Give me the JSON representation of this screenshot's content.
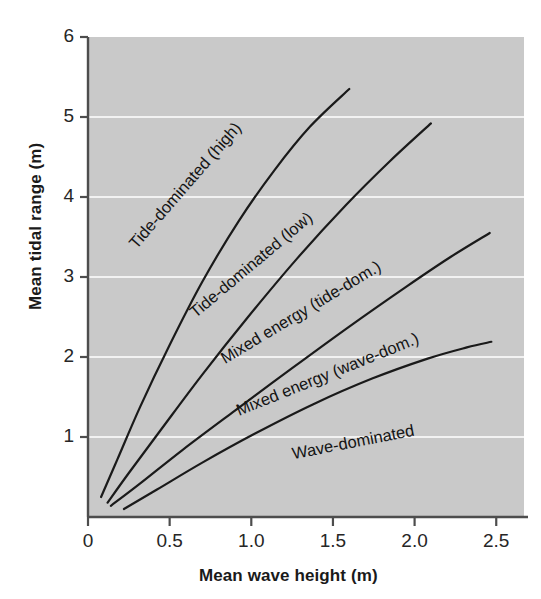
{
  "figure": {
    "background_color": "#ffffff",
    "plot_background_color": "#c9c9c9",
    "gridline_color": "#f2f2f2",
    "axis_color": "#4d4d4d",
    "curve_color": "#1a1a1a",
    "text_color": "#1a1a1a"
  },
  "chart_data": {
    "type": "line",
    "title": "",
    "xlabel": "Mean wave height (m)",
    "ylabel": "Mean tidal range (m)",
    "xlim": [
      0,
      2.67
    ],
    "ylim": [
      0,
      6
    ],
    "xticks": [
      0,
      0.5,
      1.0,
      1.5,
      2.0,
      2.5
    ],
    "xtick_labels": [
      "0",
      "0.5",
      "1.0",
      "1.5",
      "2.0",
      "2.5"
    ],
    "yticks": [
      1,
      2,
      3,
      4,
      5,
      6
    ],
    "ytick_labels": [
      "1",
      "2",
      "3",
      "4",
      "5",
      "6"
    ],
    "grid": "horizontal-only (white lines at y = 1,2,3,4,5)",
    "legend": "none (curves annotated inline)",
    "annotations": [
      {
        "text": "Tide-dominated (high)",
        "x": 0.62,
        "y": 4.1,
        "rotation": -49
      },
      {
        "text": "Tide-dominated (low)",
        "x": 1.02,
        "y": 3.1,
        "rotation": -40
      },
      {
        "text": "Mixed energy (tide-dom.)",
        "x": 1.32,
        "y": 2.5,
        "rotation": -31
      },
      {
        "text": "Mixed energy (wave-dom.)",
        "x": 1.48,
        "y": 1.72,
        "rotation": -22
      },
      {
        "text": "Wave-dominated",
        "x": 1.63,
        "y": 0.87,
        "rotation": -11
      }
    ],
    "series": [
      {
        "name": "Tide-dominated (high) boundary",
        "x": [
          0.08,
          0.18,
          0.32,
          0.5,
          0.7,
          0.92,
          1.14,
          1.36,
          1.6
        ],
        "y": [
          0.25,
          0.72,
          1.38,
          2.15,
          2.94,
          3.69,
          4.33,
          4.88,
          5.35
        ]
      },
      {
        "name": "Tide-dominated (low) boundary",
        "x": [
          0.12,
          0.25,
          0.45,
          0.7,
          0.98,
          1.28,
          1.58,
          1.85,
          2.1
        ],
        "y": [
          0.18,
          0.55,
          1.1,
          1.78,
          2.5,
          3.23,
          3.9,
          4.45,
          4.92
        ]
      },
      {
        "name": "Mixed energy (tide-dom.) boundary",
        "x": [
          0.14,
          0.32,
          0.58,
          0.9,
          1.25,
          1.6,
          1.95,
          2.22,
          2.46
        ],
        "y": [
          0.14,
          0.42,
          0.84,
          1.33,
          1.86,
          2.38,
          2.88,
          3.25,
          3.55
        ]
      },
      {
        "name": "Mixed energy (wave-dom.) boundary",
        "x": [
          0.22,
          0.42,
          0.7,
          1.02,
          1.38,
          1.74,
          2.08,
          2.32,
          2.47
        ],
        "y": [
          0.1,
          0.34,
          0.68,
          1.04,
          1.41,
          1.73,
          1.98,
          2.12,
          2.19
        ]
      }
    ]
  }
}
